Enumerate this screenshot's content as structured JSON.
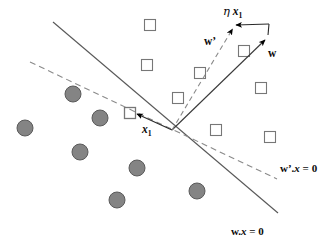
{
  "figure": {
    "width": 334,
    "height": 250,
    "background": "#ffffff"
  },
  "labels": {
    "eta_x1": {
      "prefix": "η",
      "symbol": "x",
      "subscript": "1"
    },
    "w_prime": {
      "text": "w’"
    },
    "w": {
      "text": "w"
    },
    "x1": {
      "symbol": "x",
      "subscript": "1"
    },
    "w_prime_dot_x_eq_0": {
      "vector": "w’",
      "dot": ".",
      "x": "x",
      "equals": " = 0"
    },
    "w_dot_x_eq_0": {
      "vector": "w",
      "dot": ".",
      "x": "x",
      "equals": " = 0"
    }
  },
  "colors": {
    "line": "#555555",
    "dashed_line": "#808080",
    "square_stroke": "#777777",
    "circle_fill": "#808080",
    "circle_stroke": "#555555",
    "arrow": "#000000",
    "text": "#0b0b0b"
  },
  "geometry": {
    "origin": {
      "x": 172,
      "y": 130
    },
    "solid_boundary": {
      "x1": 53,
      "y1": 22,
      "x2": 278,
      "y2": 213,
      "label": "w.x = 0"
    },
    "dashed_boundary": {
      "x1": 30,
      "y1": 62,
      "x2": 277,
      "y2": 179,
      "label": "w’.x = 0"
    },
    "vector_w": {
      "x1": 172,
      "y1": 130,
      "x2": 267,
      "y2": 38
    },
    "vector_w_prime": {
      "x1": 172,
      "y1": 130,
      "x2": 233,
      "y2": 27,
      "style": "dashed"
    },
    "vector_eta_x1": {
      "x1": 267,
      "y1": 24,
      "x2": 234,
      "y2": 24,
      "style": "solid"
    },
    "vector_eta_x1_connector": {
      "x1": 267,
      "y1": 38,
      "x2": 267,
      "y2": 24
    },
    "vector_x1": {
      "x1": 172,
      "y1": 130,
      "x2": 136,
      "y2": 113
    }
  },
  "points": {
    "squares": [
      {
        "x": 150,
        "y": 25,
        "size": 11
      },
      {
        "x": 147,
        "y": 65,
        "size": 11
      },
      {
        "x": 244,
        "y": 51,
        "size": 11
      },
      {
        "x": 200,
        "y": 73,
        "size": 11
      },
      {
        "x": 178,
        "y": 98,
        "size": 11
      },
      {
        "x": 261,
        "y": 88,
        "size": 11
      },
      {
        "x": 216,
        "y": 130,
        "size": 11
      },
      {
        "x": 270,
        "y": 137,
        "size": 11
      },
      {
        "x": 130,
        "y": 113,
        "size": 11
      }
    ],
    "circles": [
      {
        "x": 73,
        "y": 94,
        "r": 8
      },
      {
        "x": 100,
        "y": 118,
        "r": 8
      },
      {
        "x": 25,
        "y": 128,
        "r": 8
      },
      {
        "x": 80,
        "y": 152,
        "r": 8
      },
      {
        "x": 137,
        "y": 168,
        "r": 8
      },
      {
        "x": 117,
        "y": 200,
        "r": 8
      },
      {
        "x": 197,
        "y": 191,
        "r": 8
      }
    ]
  }
}
